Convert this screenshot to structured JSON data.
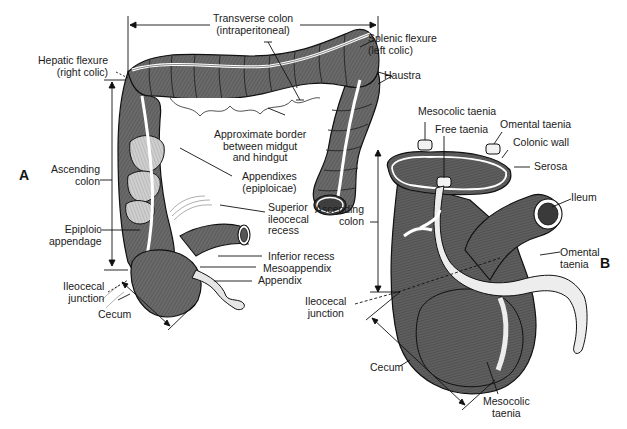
{
  "figure": {
    "panels": {
      "A": {
        "letter": "A"
      },
      "B": {
        "letter": "B"
      }
    },
    "colors": {
      "background": "#ffffff",
      "tissue_dark": "#5f5f5f",
      "tissue_mid": "#7a7a7a",
      "tissue_light": "#d8d8d8",
      "outline": "#111111",
      "label_text": "#1a1a1a"
    }
  },
  "panel_a": {
    "labels": {
      "transverse_colon": "Transverse colon\n(intraperitoneal)",
      "hepatic_flexure": "Hepatic flexure\n(right colic)",
      "splenic_flexure": "Splenic flexure\n(left colic)",
      "haustra": "Haustra",
      "approx_border": "Approximate border\nbetween midgut\nand hindgut",
      "ascending_colon": "Ascending\ncolon",
      "appendixes": "Appendixes\n(epiploicae)",
      "superior_recess": "Superior\nileocecal\nrecess",
      "epiploic_appendage": "Epiploic\nappendage",
      "inferior_recess": "Inferior recess",
      "mesoappendix": "Mesoappendix",
      "appendix": "Appendix",
      "ileocecal_junction": "Ileocecal\njunction",
      "cecum": "Cecum"
    }
  },
  "panel_b": {
    "labels": {
      "mesocolic_taenia_top": "Mesocolic taenia",
      "free_taenia": "Free taenia",
      "omental_taenia_top": "Omental taenia",
      "colonic_wall": "Colonic wall",
      "serosa": "Serosa",
      "ileum": "Ileum",
      "ascending_colon": "Ascending\ncolon",
      "omental_taenia": "Omental\ntaenia",
      "ileocecal_junction": "Ileocecal\njunction",
      "cecum": "Cecum",
      "mesocolic_taenia_bottom": "Mesocolic\ntaenia"
    }
  }
}
